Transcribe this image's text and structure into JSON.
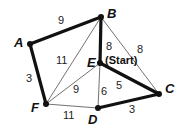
{
  "graph": {
    "nodes": [
      {
        "id": "A",
        "label": "A",
        "x": 30,
        "y": 44,
        "lx": 14,
        "ly": 47
      },
      {
        "id": "B",
        "label": "B",
        "x": 101,
        "y": 17,
        "lx": 107,
        "ly": 18
      },
      {
        "id": "C",
        "label": "C",
        "x": 159,
        "y": 94,
        "lx": 165,
        "ly": 93
      },
      {
        "id": "D",
        "label": "D",
        "x": 98,
        "y": 108,
        "lx": 88,
        "ly": 124
      },
      {
        "id": "E",
        "label": "E",
        "x": 100,
        "y": 63,
        "lx": 87,
        "ly": 67
      },
      {
        "id": "F",
        "label": "F",
        "x": 46,
        "y": 104,
        "lx": 31,
        "ly": 112
      }
    ],
    "edges": [
      {
        "from": "A",
        "to": "B",
        "weight": "9",
        "highlighted": true,
        "wx": 58,
        "wy": 24
      },
      {
        "from": "A",
        "to": "F",
        "weight": "3",
        "highlighted": true,
        "wx": 26,
        "wy": 82
      },
      {
        "from": "B",
        "to": "E",
        "weight": "8",
        "highlighted": true,
        "wx": 106,
        "wy": 50
      },
      {
        "from": "E",
        "to": "C",
        "weight": "5",
        "highlighted": true,
        "wx": 116,
        "wy": 89
      },
      {
        "from": "C",
        "to": "D",
        "weight": "3",
        "highlighted": true,
        "wx": 129,
        "wy": 113
      },
      {
        "from": "B",
        "to": "F",
        "weight": "11",
        "highlighted": false,
        "wx": 56,
        "wy": 64
      },
      {
        "from": "B",
        "to": "C",
        "weight": "8",
        "highlighted": false,
        "wx": 137,
        "wy": 53
      },
      {
        "from": "E",
        "to": "F",
        "weight": "9",
        "highlighted": false,
        "wx": 73,
        "wy": 93
      },
      {
        "from": "E",
        "to": "D",
        "weight": "6",
        "highlighted": false,
        "wx": 101,
        "wy": 95
      },
      {
        "from": "F",
        "to": "D",
        "weight": "11",
        "highlighted": false,
        "wx": 63,
        "wy": 119
      }
    ],
    "start_node": "E",
    "start_label": "(Start)",
    "start_label_pos": {
      "x": 105,
      "y": 64
    }
  }
}
